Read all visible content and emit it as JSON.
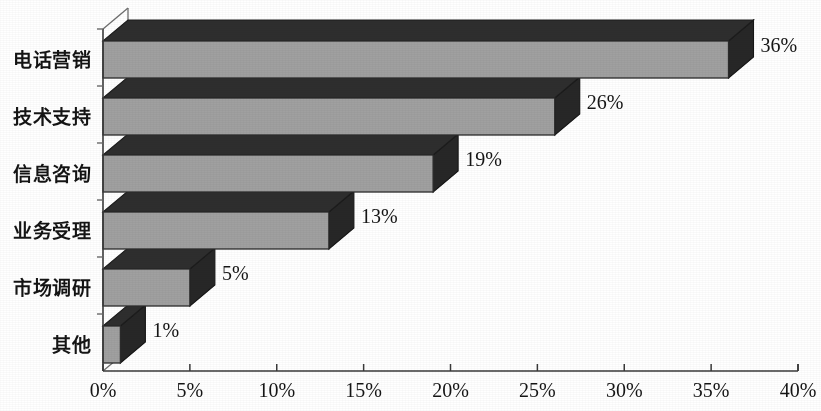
{
  "chart_data": {
    "type": "bar",
    "orientation": "horizontal",
    "style": "3d",
    "title": "",
    "subtitle": "",
    "xlabel": "",
    "ylabel": "",
    "categories": [
      "电话营销",
      "技术支持",
      "信息咨询",
      "业务受理",
      "市场调研",
      "其他"
    ],
    "values": [
      36,
      26,
      19,
      13,
      5,
      1
    ],
    "data_labels": [
      "36%",
      "26%",
      "19%",
      "13%",
      "5%",
      "1%"
    ],
    "xlim": [
      0,
      40
    ],
    "xticks": [
      0,
      5,
      10,
      15,
      20,
      25,
      30,
      35,
      40
    ],
    "xtick_labels": [
      "0%",
      "5%",
      "10%",
      "15%",
      "20%",
      "25%",
      "30%",
      "35%",
      "40%"
    ],
    "grid": false,
    "legend": null,
    "legend_position": "none",
    "series": [
      {
        "name": "",
        "values": [
          36,
          26,
          19,
          13,
          5,
          1
        ]
      }
    ],
    "colors": {
      "bar_face": "#a0a0a0",
      "bar_top": "#2e2e2e",
      "bar_side": "#272727",
      "outline": "#2b2b2b",
      "axis": "#3a3a3a",
      "text": "#151515",
      "background": "#ffffff"
    }
  },
  "axis": {
    "x_axis_name": "x-axis",
    "y_axis_name": "y-axis"
  }
}
